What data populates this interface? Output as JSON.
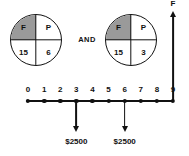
{
  "diagram": {
    "operator_label": "AND",
    "accent_color": "#111111",
    "shade_color": "#9a9a9a",
    "background_color": "#ffffff"
  },
  "tvm_circles": [
    {
      "name": "left-tvm-circle",
      "quadrants": {
        "top_left": "F",
        "top_right": "P",
        "bottom_left": "15",
        "bottom_right": "6"
      },
      "shaded_quadrant": "top_left"
    },
    {
      "name": "right-tvm-circle",
      "quadrants": {
        "top_left": "F",
        "top_right": "P",
        "bottom_left": "15",
        "bottom_right": "3"
      },
      "shaded_quadrant": "top_left"
    }
  ],
  "chart_data": {
    "type": "timeline",
    "title": "",
    "xlabel": "",
    "ylabel": "",
    "axis_ticks": [
      "0",
      "1",
      "2",
      "3",
      "4",
      "5",
      "6",
      "7",
      "8",
      "9"
    ],
    "axis_range": [
      0,
      9
    ],
    "grid": false,
    "legend": "none",
    "cash_flows": [
      {
        "period": "3",
        "amount": "$2500",
        "direction": "down"
      },
      {
        "period": "6",
        "amount": "$2500",
        "direction": "down"
      },
      {
        "period": "9",
        "amount": "F",
        "direction": "up"
      }
    ]
  }
}
